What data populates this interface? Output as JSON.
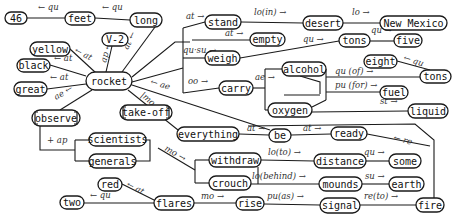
{
  "diagram": {
    "type": "conceptual-dependency-network",
    "central_node": "rocket",
    "nodes": [
      {
        "id": "n46",
        "label": "46",
        "x": 5,
        "y": 12,
        "w": 22,
        "h": 12
      },
      {
        "id": "feet",
        "label": "feet",
        "x": 65,
        "y": 12,
        "w": 30,
        "h": 13
      },
      {
        "id": "long",
        "label": "long",
        "x": 130,
        "y": 13,
        "w": 32,
        "h": 14
      },
      {
        "id": "v2",
        "label": "V-2",
        "x": 102,
        "y": 33,
        "w": 26,
        "h": 13
      },
      {
        "id": "yellow",
        "label": "yellow",
        "x": 30,
        "y": 42,
        "w": 40,
        "h": 14
      },
      {
        "id": "black",
        "label": "black",
        "x": 17,
        "y": 59,
        "w": 33,
        "h": 13
      },
      {
        "id": "rocket",
        "label": "rocket",
        "x": 86,
        "y": 72,
        "w": 46,
        "h": 18
      },
      {
        "id": "great",
        "label": "great",
        "x": 14,
        "y": 82,
        "w": 33,
        "h": 14
      },
      {
        "id": "observe",
        "label": "observe",
        "x": 32,
        "y": 110,
        "w": 48,
        "h": 16,
        "bracketed": true
      },
      {
        "id": "takeoff",
        "label": "take-off",
        "x": 120,
        "y": 105,
        "w": 52,
        "h": 15,
        "bracketed": true
      },
      {
        "id": "stand",
        "label": "stand",
        "x": 205,
        "y": 15,
        "w": 36,
        "h": 14
      },
      {
        "id": "empty",
        "label": "empty",
        "x": 250,
        "y": 33,
        "w": 35,
        "h": 13
      },
      {
        "id": "weigh",
        "label": "weigh",
        "x": 205,
        "y": 51,
        "w": 35,
        "h": 14
      },
      {
        "id": "carry",
        "label": "carry",
        "x": 219,
        "y": 81,
        "w": 34,
        "h": 14
      },
      {
        "id": "desert",
        "label": "desert",
        "x": 303,
        "y": 16,
        "w": 40,
        "h": 14
      },
      {
        "id": "newmexico",
        "label": "New Mexico",
        "x": 380,
        "y": 16,
        "w": 67,
        "h": 14
      },
      {
        "id": "tons1",
        "label": "tons",
        "x": 339,
        "y": 34,
        "w": 31,
        "h": 13
      },
      {
        "id": "five",
        "label": "five",
        "x": 394,
        "y": 34,
        "w": 28,
        "h": 13
      },
      {
        "id": "eight",
        "label": "eight",
        "x": 364,
        "y": 55,
        "w": 33,
        "h": 13
      },
      {
        "id": "tons2",
        "label": "tons",
        "x": 420,
        "y": 70,
        "w": 31,
        "h": 13
      },
      {
        "id": "alcohol",
        "label": "alcohol",
        "x": 282,
        "y": 62,
        "w": 44,
        "h": 14
      },
      {
        "id": "oxygen",
        "label": "oxygen",
        "x": 268,
        "y": 103,
        "w": 44,
        "h": 14
      },
      {
        "id": "fuel",
        "label": "fuel",
        "x": 380,
        "y": 86,
        "w": 28,
        "h": 13
      },
      {
        "id": "liquid",
        "label": "liquid",
        "x": 408,
        "y": 104,
        "w": 40,
        "h": 14
      },
      {
        "id": "everything",
        "label": "everything",
        "x": 177,
        "y": 127,
        "w": 62,
        "h": 14
      },
      {
        "id": "be",
        "label": "be",
        "x": 269,
        "y": 129,
        "w": 22,
        "h": 13
      },
      {
        "id": "ready",
        "label": "ready",
        "x": 331,
        "y": 127,
        "w": 36,
        "h": 13
      },
      {
        "id": "scientists",
        "label": "scientists",
        "x": 89,
        "y": 133,
        "w": 57,
        "h": 13
      },
      {
        "id": "generals",
        "label": "generals",
        "x": 89,
        "y": 154,
        "w": 47,
        "h": 14
      },
      {
        "id": "withdraw",
        "label": "withdraw",
        "x": 209,
        "y": 153,
        "w": 52,
        "h": 14
      },
      {
        "id": "distance",
        "label": "distance",
        "x": 314,
        "y": 154,
        "w": 52,
        "h": 14
      },
      {
        "id": "some",
        "label": "some",
        "x": 389,
        "y": 154,
        "w": 32,
        "h": 14
      },
      {
        "id": "crouch",
        "label": "crouch",
        "x": 209,
        "y": 176,
        "w": 42,
        "h": 14
      },
      {
        "id": "mounds",
        "label": "mounds",
        "x": 319,
        "y": 177,
        "w": 43,
        "h": 14
      },
      {
        "id": "earth",
        "label": "earth",
        "x": 389,
        "y": 177,
        "w": 35,
        "h": 14
      },
      {
        "id": "red",
        "label": "red",
        "x": 98,
        "y": 178,
        "w": 24,
        "h": 13
      },
      {
        "id": "two",
        "label": "two",
        "x": 60,
        "y": 196,
        "w": 24,
        "h": 13
      },
      {
        "id": "flares",
        "label": "flares",
        "x": 154,
        "y": 196,
        "w": 40,
        "h": 14
      },
      {
        "id": "rise",
        "label": "rise",
        "x": 236,
        "y": 197,
        "w": 28,
        "h": 13
      },
      {
        "id": "signal",
        "label": "signal",
        "x": 320,
        "y": 198,
        "w": 40,
        "h": 15
      },
      {
        "id": "fire",
        "label": "fire",
        "x": 416,
        "y": 198,
        "w": 28,
        "h": 14
      }
    ],
    "edges": [
      {
        "path": "M27,18 L65,18",
        "label": "← qu",
        "lx": 38,
        "ly": 10
      },
      {
        "path": "M95,18 L130,20",
        "label": "← qu",
        "lx": 102,
        "ly": 10
      },
      {
        "path": "M155,27 L122,72",
        "label": "at ←",
        "lx": 128,
        "ly": 50,
        "rotate": -65
      },
      {
        "path": "M112,46 L106,72",
        "label": "ap ←",
        "lx": 106,
        "ly": 63,
        "rotate": -75
      },
      {
        "path": "M70,49 L96,73",
        "label": "← at",
        "lx": 74,
        "ly": 52,
        "rotate": 28
      },
      {
        "path": "M50,65 L86,76",
        "label": "← at",
        "lx": 54,
        "ly": 61
      },
      {
        "path": "M47,89 L86,84",
        "label": "← at",
        "lx": 50,
        "ly": 80
      },
      {
        "path": "M60,110 L92,90",
        "label": "ae ←",
        "lx": 56,
        "ly": 100,
        "rotate": -30
      },
      {
        "path": "M132,77 L175,42 L190,42",
        "label": "",
        "lx": 0,
        "ly": 0
      },
      {
        "path": "M183,28 L183,93",
        "label": "",
        "lx": 0,
        "ly": 0
      },
      {
        "path": "M183,28 L205,22",
        "label": "at →",
        "lx": 186,
        "ly": 19
      },
      {
        "path": "M192,40 L250,40",
        "label": "at →",
        "lx": 225,
        "ly": 36
      },
      {
        "path": "M183,58 L205,58",
        "label": "qu·su →",
        "lx": 183,
        "ly": 53
      },
      {
        "path": "M132,82 L183,68",
        "label": "",
        "lx": 0,
        "ly": 0
      },
      {
        "path": "M183,93 L219,88",
        "label": "oo →",
        "lx": 188,
        "ly": 84
      },
      {
        "path": "M132,85 L270,130",
        "label": "← ae",
        "lx": 150,
        "ly": 84,
        "rotate": 17
      },
      {
        "path": "M128,90 L178,130",
        "label": "|mo →",
        "lx": 140,
        "ly": 96,
        "rotate": 40
      },
      {
        "path": "M241,22 L303,23",
        "label": "lo(in) →",
        "lx": 254,
        "ly": 15
      },
      {
        "path": "M343,23 L380,23",
        "label": "lo →",
        "lx": 352,
        "ly": 15
      },
      {
        "path": "M240,58 L339,41",
        "label": "qu →",
        "lx": 303,
        "ly": 42
      },
      {
        "path": "M370,41 L394,41",
        "label": "qu →",
        "lx": 371,
        "ly": 33
      },
      {
        "path": "M397,61 L430,70",
        "label": "← qu",
        "lx": 403,
        "ly": 60,
        "rotate": 18
      },
      {
        "path": "M253,88 L265,88",
        "label": "ae →",
        "lx": 255,
        "ly": 80
      },
      {
        "path": "M265,69 L265,110",
        "label": "",
        "lx": 0,
        "ly": 0
      },
      {
        "path": "M265,69 L282,69",
        "label": "",
        "lx": 0,
        "ly": 0
      },
      {
        "path": "M265,110 L268,110",
        "label": "",
        "lx": 0,
        "ly": 0
      },
      {
        "path": "M326,69 L326,100",
        "label": "",
        "lx": 0,
        "ly": 0
      },
      {
        "path": "M300,76 L320,82 L320,94",
        "label": "",
        "lx": 0,
        "ly": 0
      },
      {
        "path": "M284,95 L320,95",
        "label": "",
        "lx": 0,
        "ly": 0
      },
      {
        "path": "M312,107 L326,100",
        "label": "",
        "lx": 0,
        "ly": 0
      },
      {
        "path": "M326,77 L420,77",
        "label": "qu (of) →",
        "lx": 335,
        "ly": 74
      },
      {
        "path": "M326,92 L380,92",
        "label": "pu (for) →",
        "lx": 335,
        "ly": 88
      },
      {
        "path": "M312,112 L408,111",
        "label": "st →",
        "lx": 380,
        "ly": 104
      },
      {
        "path": "M239,134 L269,135",
        "label": "at →",
        "lx": 247,
        "ly": 131
      },
      {
        "path": "M291,135 L331,134",
        "label": "at →",
        "lx": 303,
        "ly": 131
      },
      {
        "path": "M367,134 L430,146",
        "label": "← re",
        "lx": 393,
        "ly": 140,
        "rotate": 15
      },
      {
        "path": "M248,126 L415,124 L434,140 L434,198",
        "label": "",
        "lx": 0,
        "ly": 0
      },
      {
        "path": "M40,126 L40,150 L75,150",
        "label": "+ ap",
        "lx": 47,
        "ly": 143
      },
      {
        "path": "M75,140 L75,161",
        "label": "",
        "lx": 0,
        "ly": 0
      },
      {
        "path": "M75,140 L89,140",
        "label": "",
        "lx": 0,
        "ly": 0
      },
      {
        "path": "M75,161 L89,161",
        "label": "",
        "lx": 0,
        "ly": 0
      },
      {
        "path": "M146,140 L150,140 L150,161 L136,161",
        "label": "",
        "lx": 0,
        "ly": 0
      },
      {
        "path": "M158,148 L195,170",
        "label": "mo →",
        "lx": 164,
        "ly": 150,
        "rotate": 30
      },
      {
        "path": "M195,160 L195,183",
        "label": "",
        "lx": 0,
        "ly": 0
      },
      {
        "path": "M195,160 L209,160",
        "label": "",
        "lx": 0,
        "ly": 0
      },
      {
        "path": "M195,183 L209,183",
        "label": "",
        "lx": 0,
        "ly": 0
      },
      {
        "path": "M261,160 L314,161",
        "label": "lo(to) →",
        "lx": 268,
        "ly": 155
      },
      {
        "path": "M366,161 L389,161",
        "label": "qu →",
        "lx": 364,
        "ly": 155
      },
      {
        "path": "M258,167 L258,184",
        "label": "",
        "lx": 0,
        "ly": 0
      },
      {
        "path": "M251,184 L319,184",
        "label": "lo(behind) →",
        "lx": 252,
        "ly": 179
      },
      {
        "path": "M362,184 L389,184",
        "label": "su →",
        "lx": 365,
        "ly": 179
      },
      {
        "path": "M122,184 L154,200",
        "label": "← at",
        "lx": 126,
        "ly": 186,
        "rotate": 28
      },
      {
        "path": "M84,203 L154,203",
        "label": "← qu",
        "lx": 90,
        "ly": 198
      },
      {
        "path": "M194,203 L236,203",
        "label": "mo →",
        "lx": 201,
        "ly": 199
      },
      {
        "path": "M264,204 L320,205",
        "label": "pu(as) →",
        "lx": 267,
        "ly": 199
      },
      {
        "path": "M360,205 L416,205",
        "label": "re(to) →",
        "lx": 364,
        "ly": 199
      }
    ]
  }
}
